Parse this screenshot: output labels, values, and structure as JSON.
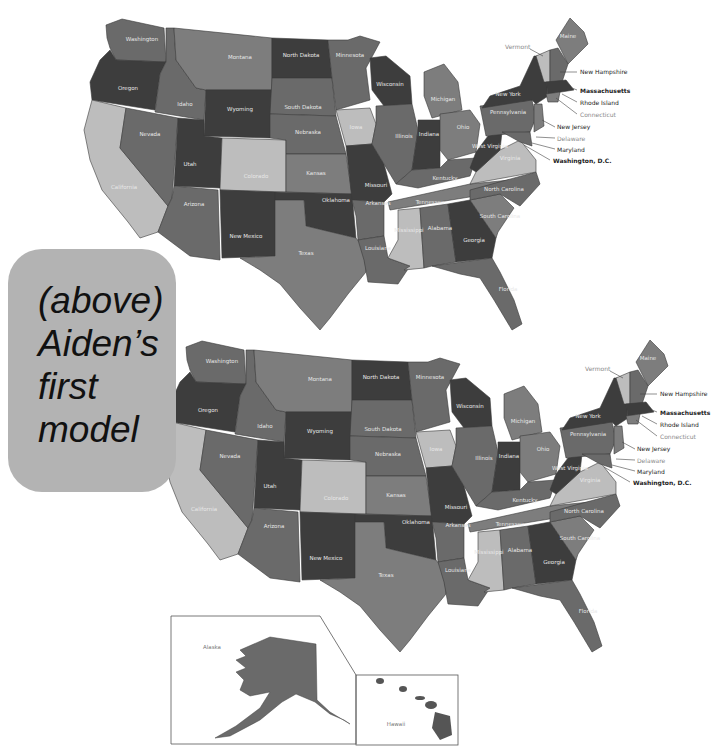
{
  "note": {
    "lines": [
      "(above)",
      "Aiden’s",
      "first",
      "model"
    ],
    "background": "#b3b3b3"
  },
  "shade": {
    "dark": "#3d3d3d",
    "mid": "#6a6a6a",
    "midlight": "#7d7d7d",
    "light": "#bdbdbd"
  },
  "map_top": {
    "states": [
      "Washington",
      "Oregon",
      "California",
      "Idaho",
      "Nevada",
      "Montana",
      "Wyoming",
      "Utah",
      "Arizona",
      "Colorado",
      "New Mexico",
      "North Dakota",
      "South Dakota",
      "Nebraska",
      "Kansas",
      "Oklahoma",
      "Texas",
      "Minnesota",
      "Iowa",
      "Missouri",
      "Arkansas",
      "Louisiana",
      "Wisconsin",
      "Illinois",
      "Michigan",
      "Indiana",
      "Ohio",
      "Kentucky",
      "Tennessee",
      "Mississippi",
      "Alabama",
      "Georgia",
      "Florida",
      "South Carolina",
      "North Carolina",
      "Virginia",
      "West Virginia",
      "Pennsylvania",
      "New York",
      "Maine"
    ],
    "callouts": [
      "Vermont",
      "New Hampshire",
      "Massachusetts",
      "Rhode Island",
      "Connecticut",
      "New Jersey",
      "Delaware",
      "Maryland",
      "Washington, D.C."
    ]
  },
  "map_bottom": {
    "states": [
      "Washington",
      "Oregon",
      "California",
      "Idaho",
      "Nevada",
      "Montana",
      "Wyoming",
      "Utah",
      "Arizona",
      "Colorado",
      "New Mexico",
      "North Dakota",
      "South Dakota",
      "Nebraska",
      "Kansas",
      "Oklahoma",
      "Texas",
      "Minnesota",
      "Iowa",
      "Missouri",
      "Arkansas",
      "Louisiana",
      "Wisconsin",
      "Illinois",
      "Michigan",
      "Indiana",
      "Ohio",
      "Kentucky",
      "Tennessee",
      "Mississippi",
      "Alabama",
      "Georgia",
      "Florida",
      "South Carolina",
      "North Carolina",
      "Virginia",
      "West Virginia",
      "Pennsylvania",
      "New York",
      "Maine"
    ],
    "callouts": [
      "Vermont",
      "New Hampshire",
      "Massachusetts",
      "Rhode Island",
      "Connecticut",
      "New Jersey",
      "Delaware",
      "Maryland",
      "Washington, D.C."
    ],
    "insets": {
      "alaska": "Alaska",
      "hawaii": "Hawaii"
    }
  }
}
